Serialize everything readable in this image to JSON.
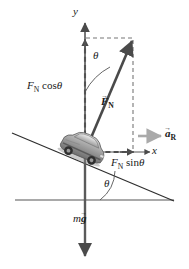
{
  "figure": {
    "width": 189,
    "height": 269,
    "background": "#ffffff"
  },
  "colors": {
    "axis": "#555555",
    "vector_dark": "#4a4a4a",
    "vector_light": "#aaaaaa",
    "line": "#333333",
    "dashed": "#777777",
    "text": "#1a1a1a"
  },
  "axes": {
    "y_label": "y",
    "x_label": "x",
    "origin": {
      "x": 85,
      "y": 152
    }
  },
  "angles": [
    {
      "name": "theta-top",
      "label": "θ",
      "description": "angle between y-axis and normal force vector"
    },
    {
      "name": "theta-bottom",
      "label": "θ",
      "description": "bank angle between incline and horizontal"
    }
  ],
  "vectors": [
    {
      "name": "normal-force",
      "label_base": "F",
      "label_sub": "N",
      "accent": "→",
      "bold": true,
      "color": "#4a4a4a",
      "from": {
        "x": 85,
        "y": 152
      },
      "to": {
        "x": 133,
        "y": 38
      }
    },
    {
      "name": "normal-force-y-component",
      "label": "Fₙ cos θ",
      "label_base": "F",
      "label_sub": "N",
      "label_trig": "cos",
      "label_angle": "θ",
      "color": "#4a4a4a",
      "from": {
        "x": 85,
        "y": 152
      },
      "to": {
        "x": 85,
        "y": 38
      }
    },
    {
      "name": "normal-force-x-component",
      "label": "Fₙ sin θ",
      "label_base": "F",
      "label_sub": "N",
      "label_trig": "sin",
      "label_angle": "θ",
      "color": "#4a4a4a",
      "from": {
        "x": 85,
        "y": 152
      },
      "to": {
        "x": 133,
        "y": 152
      }
    },
    {
      "name": "radial-acceleration",
      "label_base": "a",
      "label_sub": "R",
      "accent": "→",
      "bold": true,
      "color": "#aaaaaa",
      "from": {
        "x": 139,
        "y": 136
      },
      "to": {
        "x": 163,
        "y": 136
      }
    },
    {
      "name": "weight",
      "label_base": "m",
      "label_vec": "g",
      "accent": "→",
      "bold": true,
      "color": "#4a4a4a",
      "from": {
        "x": 85,
        "y": 152
      },
      "to": {
        "x": 85,
        "y": 258
      }
    }
  ],
  "labels": {
    "y_axis": "y",
    "x_axis": "x",
    "theta_top": "θ",
    "theta_bottom": "θ",
    "fn_cos_base": "F",
    "fn_cos_sub": "N",
    "fn_cos_trig": "cos",
    "fn_cos_angle": "θ",
    "fn_sin_base": "F",
    "fn_sin_sub": "N",
    "fn_sin_trig": "sin",
    "fn_sin_angle": "θ",
    "fn_base": "F",
    "fn_sub": "N",
    "fn_accent": "→",
    "ar_base": "a",
    "ar_sub": "R",
    "ar_accent": "→",
    "mg_mass": "m",
    "mg_grav": "g",
    "mg_accent": "→"
  },
  "scene": {
    "incline": {
      "from": {
        "x": 12,
        "y": 133
      },
      "to": {
        "x": 174,
        "y": 201
      }
    },
    "ground": {
      "from": {
        "x": 15,
        "y": 200
      },
      "to": {
        "x": 174,
        "y": 200
      }
    },
    "car": {
      "name": "car-on-incline",
      "x": 58,
      "y": 131,
      "width": 50,
      "height": 31
    },
    "dashed_box": {
      "x1": 85,
      "y1": 38,
      "x2": 133,
      "y2": 152
    }
  }
}
